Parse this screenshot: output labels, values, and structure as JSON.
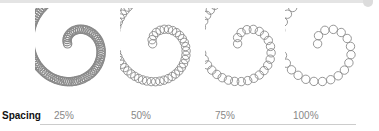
{
  "figure": {
    "row_label": "Spacing",
    "samples": [
      {
        "label": "25%",
        "spacing": 0.25
      },
      {
        "label": "50%",
        "spacing": 0.5
      },
      {
        "label": "75%",
        "spacing": 0.75
      },
      {
        "label": "100%",
        "spacing": 1.0
      }
    ],
    "stroke_color": "#8a8a8a"
  }
}
